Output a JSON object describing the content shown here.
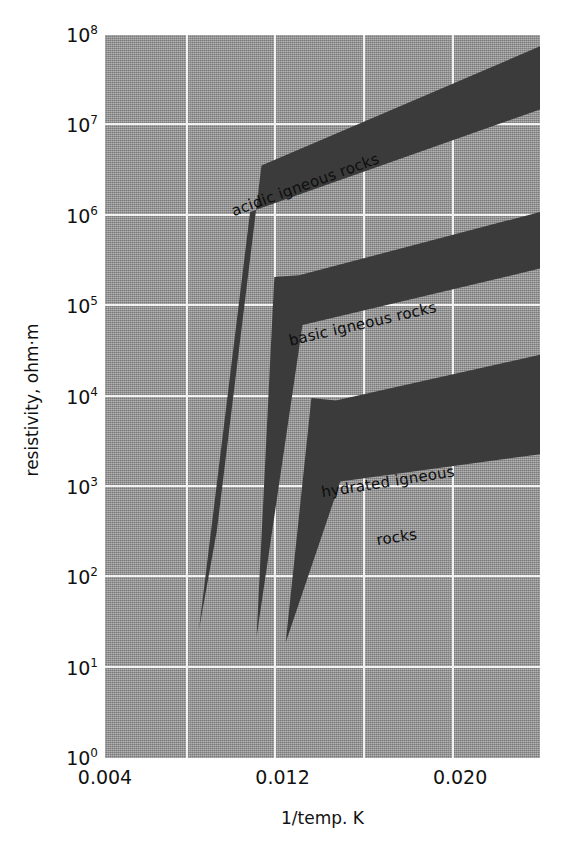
{
  "figure": {
    "background": "#ffffff",
    "plot_background": "#9d9d9d",
    "grid_color": "#f2f2f2",
    "band_color": "#3b3b3b"
  },
  "axes": {
    "y_title": "resistivity, ohm·m",
    "x_title": "1/temp. K",
    "y_ticks": [
      {
        "mantissa": "10",
        "exponent": "8",
        "value": 100000000
      },
      {
        "mantissa": "10",
        "exponent": "7",
        "value": 10000000
      },
      {
        "mantissa": "10",
        "exponent": "6",
        "value": 1000000
      },
      {
        "mantissa": "10",
        "exponent": "5",
        "value": 100000
      },
      {
        "mantissa": "10",
        "exponent": "4",
        "value": 10000
      },
      {
        "mantissa": "10",
        "exponent": "3",
        "value": 1000
      },
      {
        "mantissa": "10",
        "exponent": "2",
        "value": 100
      },
      {
        "mantissa": "10",
        "exponent": "1",
        "value": 10
      },
      {
        "mantissa": "10",
        "exponent": "0",
        "value": 1
      }
    ],
    "x_ticks": [
      {
        "label": "0.004",
        "value": 0.004
      },
      {
        "label": "0.012",
        "value": 0.012
      },
      {
        "label": "0.020",
        "value": 0.02
      }
    ]
  },
  "chart_data": {
    "type": "area",
    "title": "",
    "subtitle": "",
    "xlabel": "1/temp. K",
    "ylabel": "resistivity, ohm·m",
    "xlim": [
      0.004,
      0.0236
    ],
    "ylim": [
      1,
      100000000
    ],
    "yscale": "log",
    "xscale": "linear",
    "grid": true,
    "legend": "inline-annotations",
    "x_gridlines": [
      0.008,
      0.012,
      0.016,
      0.02
    ],
    "y_gridlines": [
      10,
      100,
      1000,
      10000,
      100000,
      1000000,
      10000000
    ],
    "series": [
      {
        "name": "acidic igneous rocks",
        "label": "acidic igneous rocks",
        "label_rotation_deg": -20,
        "upper_bound": [
          {
            "x": 0.00904,
            "y": 330
          },
          {
            "x": 0.01105,
            "y": 3600000
          },
          {
            "x": 0.0236,
            "y": 75000000
          }
        ],
        "lower_bound": [
          {
            "x": 0.00823,
            "y": 26
          },
          {
            "x": 0.01054,
            "y": 1100000
          },
          {
            "x": 0.0236,
            "y": 15000000
          }
        ]
      },
      {
        "name": "basic igneous rocks",
        "label": "basic igneous rocks",
        "label_rotation_deg": -13,
        "upper_bound": [
          {
            "x": 0.01163,
            "y": 210000
          },
          {
            "x": 0.01275,
            "y": 220000
          },
          {
            "x": 0.0236,
            "y": 1100000
          }
        ],
        "lower_bound": [
          {
            "x": 0.01083,
            "y": 22
          },
          {
            "x": 0.0129,
            "y": 62000
          },
          {
            "x": 0.0236,
            "y": 260000
          }
        ]
      },
      {
        "name": "hydrated igneous rocks",
        "label": "hydrated igneous rocks\nrocks",
        "label_line1": "hydrated igneous",
        "label_line2": "rocks",
        "label_rotation_deg": -9,
        "upper_bound": [
          {
            "x": 0.0133,
            "y": 9600
          },
          {
            "x": 0.0144,
            "y": 9000
          },
          {
            "x": 0.0236,
            "y": 29000
          }
        ],
        "lower_bound": [
          {
            "x": 0.01214,
            "y": 19
          },
          {
            "x": 0.0146,
            "y": 1150
          },
          {
            "x": 0.0236,
            "y": 2300
          }
        ]
      }
    ]
  }
}
